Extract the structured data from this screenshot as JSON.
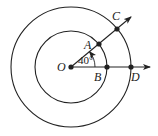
{
  "diagram": {
    "type": "concentric-circles-angle",
    "center": {
      "label": "O",
      "x": 71,
      "y": 67
    },
    "inner_circle": {
      "r": 36
    },
    "outer_circle": {
      "r": 60
    },
    "angle": {
      "label": "40°",
      "degrees": 40
    },
    "points": {
      "A": {
        "label": "A",
        "x": 99,
        "y": 44
      },
      "B": {
        "label": "B",
        "x": 107,
        "y": 67
      },
      "C": {
        "label": "C",
        "x": 117,
        "y": 29
      },
      "D": {
        "label": "D",
        "x": 131,
        "y": 67
      }
    },
    "colors": {
      "stroke": "#222222",
      "background": "#ffffff"
    }
  }
}
